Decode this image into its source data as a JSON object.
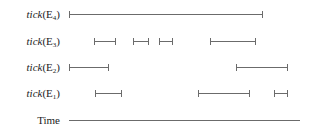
{
  "diagram": {
    "type": "timeline",
    "colors": {
      "line": "#6b6b6b",
      "text": "#222222"
    },
    "rows": [
      {
        "label_func": "tick",
        "label_arg": "E",
        "label_sub": "4",
        "y": 14,
        "intervals": [
          [
            69,
            262
          ]
        ]
      },
      {
        "label_func": "tick",
        "label_arg": "E",
        "label_sub": "3",
        "y": 41,
        "intervals": [
          [
            94,
            115
          ],
          [
            133,
            148
          ],
          [
            159,
            172
          ],
          [
            210,
            255
          ]
        ]
      },
      {
        "label_func": "tick",
        "label_arg": "E",
        "label_sub": "2",
        "y": 67,
        "intervals": [
          [
            69,
            108
          ],
          [
            236,
            287
          ]
        ]
      },
      {
        "label_func": "tick",
        "label_arg": "E",
        "label_sub": "1",
        "y": 93,
        "intervals": [
          [
            95,
            121
          ],
          [
            198,
            249
          ],
          [
            274,
            287
          ]
        ]
      }
    ],
    "time_axis": {
      "label": "Time",
      "y": 120,
      "x_start": 69,
      "x_end": 300
    }
  }
}
